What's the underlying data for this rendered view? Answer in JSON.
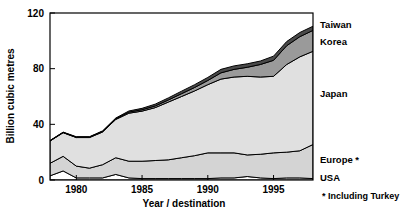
{
  "chart_data": {
    "type": "area",
    "stacked": true,
    "title": "",
    "xlabel": "Year / destination",
    "ylabel": "Billion cubic metres",
    "xlim": [
      1978,
      1998
    ],
    "ylim": [
      0,
      120
    ],
    "xticks": [
      1980,
      1985,
      1990,
      1995
    ],
    "yticks": [
      0,
      40,
      80,
      120
    ],
    "grid": false,
    "legend_position": "right-inline",
    "footnote": "* Including Turkey",
    "x": [
      1978,
      1979,
      1980,
      1981,
      1982,
      1983,
      1984,
      1985,
      1986,
      1987,
      1988,
      1989,
      1990,
      1991,
      1992,
      1993,
      1994,
      1995,
      1996,
      1997,
      1998
    ],
    "series": [
      {
        "name": "USA",
        "label": "USA",
        "color": "#ffffff",
        "values": [
          3.0,
          6.5,
          1.5,
          1.5,
          1.5,
          4.0,
          1.5,
          1.0,
          1.0,
          1.0,
          1.0,
          1.0,
          1.0,
          1.5,
          1.5,
          2.5,
          1.5,
          1.0,
          1.5,
          1.5,
          1.0
        ]
      },
      {
        "name": "Europe",
        "label": "Europe *",
        "color": "#d4d4d4",
        "values": [
          9.0,
          10.5,
          8.5,
          7.0,
          9.5,
          12.0,
          12.0,
          12.5,
          13.0,
          13.5,
          15.0,
          16.5,
          18.5,
          18.0,
          18.0,
          15.5,
          17.0,
          18.5,
          18.5,
          19.5,
          24.5
        ]
      },
      {
        "name": "Japan",
        "label": "Japan",
        "color": "#e0e0e0",
        "values": [
          16.0,
          17.0,
          20.5,
          22.0,
          23.5,
          27.5,
          34.5,
          36.0,
          38.0,
          41.5,
          44.0,
          46.5,
          49.0,
          53.0,
          54.5,
          56.5,
          55.5,
          55.0,
          63.0,
          67.5,
          67.0
        ]
      },
      {
        "name": "Korea",
        "label": "Korea",
        "color": "#9a9a9a",
        "values": [
          0.2,
          0.2,
          0.3,
          0.3,
          0.4,
          0.5,
          0.8,
          1.0,
          1.2,
          1.5,
          2.0,
          2.5,
          3.0,
          4.5,
          5.5,
          6.5,
          9.0,
          11.5,
          13.5,
          14.5,
          15.0
        ]
      },
      {
        "name": "Taiwan",
        "label": "Taiwan",
        "color": "#4a4a4a",
        "values": [
          0.2,
          0.2,
          0.3,
          0.3,
          0.4,
          0.5,
          0.8,
          1.0,
          1.3,
          1.5,
          1.8,
          2.0,
          2.2,
          2.5,
          2.5,
          2.5,
          2.5,
          3.0,
          3.0,
          3.0,
          3.0
        ]
      }
    ],
    "totals": [
      28.4,
      34.4,
      31.1,
      31.1,
      35.3,
      44.5,
      49.6,
      51.5,
      54.5,
      59.0,
      63.8,
      68.5,
      73.7,
      79.5,
      82.0,
      83.5,
      85.5,
      89.0,
      99.5,
      106.0,
      110.5
    ]
  },
  "axis": {
    "y_title": "Billion cubic metres",
    "x_title": "Year / destination",
    "y_tick_labels": [
      "0",
      "40",
      "80",
      "120"
    ],
    "x_tick_labels": [
      "1980",
      "1985",
      "1990",
      "1995"
    ]
  },
  "legend": {
    "items": [
      {
        "label": "Taiwan"
      },
      {
        "label": "Korea"
      },
      {
        "label": "Japan"
      },
      {
        "label": "Europe *"
      },
      {
        "label": "USA"
      }
    ],
    "footnote": "* Including Turkey"
  },
  "colors": {
    "taiwan": "#4a4a4a",
    "korea": "#9a9a9a",
    "japan": "#e0e0e0",
    "europe": "#d4d4d4",
    "usa": "#ffffff",
    "axis": "#000000",
    "background": "#ffffff"
  }
}
